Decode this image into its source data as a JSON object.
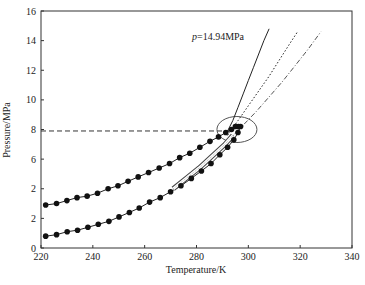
{
  "chart_data": {
    "type": "line",
    "title": "",
    "xlabel": "Temperature/K",
    "ylabel": "Pressure/MPa",
    "xlim": [
      220,
      340
    ],
    "ylim": [
      0,
      16
    ],
    "grid": false,
    "legend": null,
    "x_ticks": [
      "220",
      "240",
      "260",
      "280",
      "300",
      "320",
      "340"
    ],
    "y_ticks": [
      "0",
      "2",
      "2",
      "6",
      "8",
      "10",
      "12",
      "14",
      "16"
    ],
    "annotations": [
      {
        "text": "p=14.94MPa",
        "x": 278,
        "y": 14.4
      },
      {
        "text": "horizontal dashed reference line",
        "y": 7.9,
        "x_range": [
          220,
          293
        ]
      },
      {
        "text": "ellipse highlighting critical region",
        "center": [
          295.6,
          8.0
        ]
      }
    ],
    "series": [
      {
        "name": "upper-curve-markers",
        "style": "solid line with filled circle markers",
        "x": [
          221.8,
          226.0,
          230.0,
          233.9,
          237.8,
          241.8,
          245.9,
          249.7,
          253.6,
          257.5,
          261.5,
          265.6,
          269.6,
          273.5,
          277.4,
          281.3,
          285.2,
          288.5,
          291.3,
          293.5,
          295.0,
          296.2
        ],
        "y": [
          2.9,
          3.0,
          3.2,
          3.4,
          3.5,
          3.7,
          4.0,
          4.2,
          4.5,
          4.8,
          5.1,
          5.4,
          5.7,
          6.1,
          6.4,
          6.8,
          7.2,
          7.5,
          7.8,
          8.0,
          8.2,
          8.2
        ]
      },
      {
        "name": "lower-curve-markers",
        "style": "solid line with filled circle markers",
        "x": [
          221.8,
          226.0,
          230.1,
          234.1,
          238.1,
          242.1,
          246.2,
          250.1,
          254.1,
          257.9,
          261.9,
          266.0,
          270.0,
          274.0,
          278.0,
          281.9,
          285.6,
          289.0,
          292.0,
          294.4,
          296.0,
          297.0
        ],
        "y": [
          0.8,
          0.9,
          1.1,
          1.2,
          1.4,
          1.6,
          1.8,
          2.1,
          2.4,
          2.7,
          3.1,
          3.4,
          3.8,
          4.2,
          4.7,
          5.2,
          5.7,
          6.3,
          6.8,
          7.3,
          7.8,
          8.2
        ]
      },
      {
        "name": "p=14.94MPa (solid)",
        "style": "solid",
        "x": [
          292,
          294,
          296,
          298,
          300,
          302,
          304,
          306,
          308
        ],
        "y": [
          7.9,
          8.6,
          9.5,
          10.4,
          11.3,
          12.2,
          13.1,
          14.0,
          14.8
        ]
      },
      {
        "name": "dotted",
        "style": "dotted",
        "x": [
          292,
          296,
          300,
          304,
          308,
          312,
          316,
          319
        ],
        "y": [
          7.6,
          8.6,
          9.6,
          10.6,
          11.6,
          12.7,
          13.8,
          14.6
        ]
      },
      {
        "name": "dash-dot",
        "style": "dashed",
        "x": [
          293,
          298,
          303,
          308,
          313,
          318,
          323,
          328
        ],
        "y": [
          7.4,
          8.3,
          9.2,
          10.2,
          11.2,
          12.3,
          13.4,
          14.6
        ]
      },
      {
        "name": "band-lines",
        "style": "thin outlined band (double line)",
        "x": [
          271,
          276,
          281,
          286,
          291,
          294
        ],
        "y": [
          4.0,
          4.7,
          5.4,
          6.2,
          7.0,
          7.6
        ]
      }
    ]
  },
  "labels": {
    "xlabel": "Temperature/K",
    "ylabel": "Pressure/MPa",
    "annotation": "p=14.94MPa",
    "annotation_p": "p",
    "annotation_rest": "=14.94MPa"
  }
}
